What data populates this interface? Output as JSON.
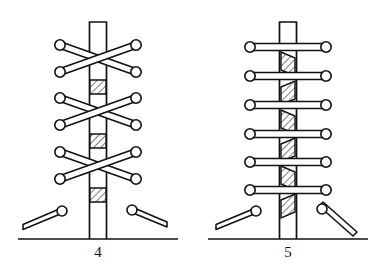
{
  "page": {
    "background_color": "#ffffff",
    "ink_color": "#111111",
    "width": 376,
    "height": 279
  },
  "figures": [
    {
      "id": "figure-4",
      "caption": "4",
      "lacing_style": "criss-cross",
      "caption_x": 98,
      "caption_y": 252,
      "post": {
        "center_x": 98,
        "top_y": 22,
        "bottom_y": 239,
        "width": 17
      },
      "ground": {
        "y": 239,
        "x_start": 18,
        "x_end": 178
      },
      "eyelet_rows_y": [
        45,
        72,
        98,
        125,
        152,
        179
      ],
      "eyelet_left_x": 60,
      "eyelet_right_x": 136,
      "eyelet_radius": 5.2,
      "crossings": 3,
      "hatch_bands": [
        {
          "x": 90,
          "y": 80,
          "w": 16,
          "h": 14
        },
        {
          "x": 90,
          "y": 134,
          "w": 16,
          "h": 14
        },
        {
          "x": 90,
          "y": 188,
          "w": 16,
          "h": 14
        }
      ],
      "loose_ends": [
        {
          "side": "left",
          "tip_x": 62,
          "tip_y": 211,
          "end_x": 23,
          "end_y": 228
        },
        {
          "side": "right",
          "tip_x": 132,
          "tip_y": 210,
          "end_x": 166,
          "end_y": 225
        }
      ]
    },
    {
      "id": "figure-5",
      "caption": "5",
      "lacing_style": "straight-bar",
      "caption_x": 288,
      "caption_y": 252,
      "post": {
        "center_x": 288,
        "top_y": 22,
        "bottom_y": 239,
        "width": 17
      },
      "ground": {
        "y": 239,
        "x_start": 208,
        "x_end": 368
      },
      "eyelet_rows_y": [
        47,
        76,
        105,
        134,
        162,
        190
      ],
      "eyelet_left_x": 250,
      "eyelet_right_x": 326,
      "eyelet_radius": 5.2,
      "rungs": 6,
      "hatch_bands": [
        {
          "x": 281,
          "y": 52,
          "w": 14,
          "h": 24
        },
        {
          "x": 281,
          "y": 81,
          "w": 14,
          "h": 24
        },
        {
          "x": 281,
          "y": 110,
          "w": 14,
          "h": 24
        },
        {
          "x": 281,
          "y": 138,
          "w": 14,
          "h": 24
        },
        {
          "x": 281,
          "y": 166,
          "w": 14,
          "h": 24
        },
        {
          "x": 281,
          "y": 194,
          "w": 14,
          "h": 24
        }
      ],
      "loose_ends": [
        {
          "side": "left",
          "tip_x": 256,
          "tip_y": 211,
          "end_x": 216,
          "end_y": 228
        },
        {
          "side": "right",
          "tip_x": 322,
          "tip_y": 209,
          "end_x": 356,
          "end_y": 240
        }
      ]
    }
  ]
}
